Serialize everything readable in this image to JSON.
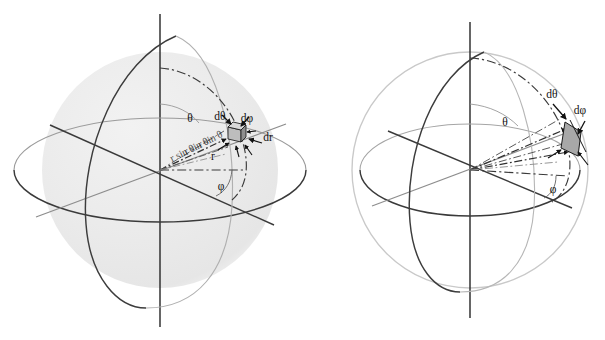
{
  "figure": {
    "background_color": "#ffffff",
    "width": 605,
    "height": 340,
    "panel_count": 2
  },
  "colors": {
    "axis_dark": "#2b2b2b",
    "outline_mid": "#555555",
    "outline_light": "#aaaaaa",
    "sphere_shade": "#ececec",
    "sphere_shade_edge": "#f4f4f4",
    "element_fill": "#9a9a9a",
    "element_stroke": "#1a1a1a",
    "dashdot": "#3a3a3a",
    "label_color": "#111111"
  },
  "panels": [
    {
      "id": "left-panel",
      "name": "shaded-sphere-with-volume-element",
      "center": {
        "x": 160,
        "y": 170
      },
      "radius": 118,
      "shaded": true,
      "labels": [
        {
          "name": "theta-label",
          "text": "θ",
          "x": 190,
          "y": 122
        },
        {
          "name": "d-theta-label",
          "text": "dθ",
          "x": 220,
          "y": 120
        },
        {
          "name": "d-phi-label",
          "text": "dφ",
          "x": 245,
          "y": 123
        },
        {
          "name": "dr-label",
          "text": "dr",
          "x": 264,
          "y": 140
        },
        {
          "name": "r-label",
          "text": "r",
          "x": 213,
          "y": 158
        },
        {
          "name": "phi-label",
          "text": "φ",
          "x": 221,
          "y": 187
        }
      ],
      "repeated_ray_text": "r sin θ"
    },
    {
      "id": "right-panel",
      "name": "outline-sphere-with-surface-element",
      "center": {
        "x": 470,
        "y": 170
      },
      "radius": 118,
      "shaded": false,
      "labels": [
        {
          "name": "theta-label",
          "text": "θ",
          "x": 505,
          "y": 124
        },
        {
          "name": "d-theta-label",
          "text": "dθ",
          "x": 551,
          "y": 98
        },
        {
          "name": "d-phi-label",
          "text": "dφ",
          "x": 577,
          "y": 114
        },
        {
          "name": "phi-label",
          "text": "φ",
          "x": 551,
          "y": 192
        }
      ]
    }
  ],
  "glyphs": {
    "theta": "θ",
    "phi": "φ",
    "d_theta": "dθ",
    "d_phi": "dφ",
    "dr": "dr",
    "r": "r"
  }
}
